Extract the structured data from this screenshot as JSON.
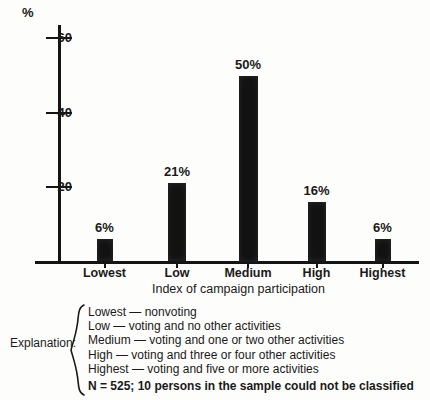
{
  "chart_data": {
    "type": "bar",
    "title": "",
    "xlabel": "Index of campaign participation",
    "ylabel": "%",
    "categories": [
      "Lowest",
      "Low",
      "Medium",
      "High",
      "Highest"
    ],
    "values": [
      6,
      21,
      50,
      16,
      6
    ],
    "value_labels": [
      "6%",
      "21%",
      "50%",
      "16%",
      "6%"
    ],
    "ylim": [
      0,
      65
    ],
    "yticks": [
      20,
      40,
      60
    ],
    "ytick_labels": [
      "20",
      "40",
      "60"
    ],
    "grid": false,
    "legend": "none",
    "bar_color": "#121212",
    "axis_color": "#141414"
  },
  "explanation": {
    "label": "Explanation:",
    "lines": [
      "Lowest — nonvoting",
      "Low — voting and no other activities",
      "Medium — voting and one or two other activities",
      "High — voting and three or four other activities",
      "Highest — voting and five or more activities"
    ],
    "note": "N = 525; 10 persons in the sample could not be classified"
  }
}
